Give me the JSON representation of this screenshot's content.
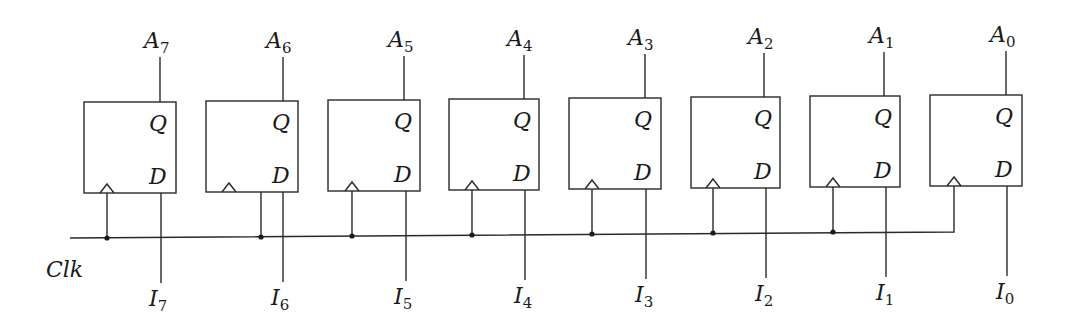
{
  "diagram": {
    "type": "8-bit parallel-load register (D flip-flops)",
    "clock_label": "Clk",
    "pin_labels": {
      "q": "Q",
      "d": "D"
    },
    "flipflops": [
      {
        "output": "A",
        "output_sub": "7",
        "input": "I",
        "input_sub": "7"
      },
      {
        "output": "A",
        "output_sub": "6",
        "input": "I",
        "input_sub": "6"
      },
      {
        "output": "A",
        "output_sub": "5",
        "input": "I",
        "input_sub": "5"
      },
      {
        "output": "A",
        "output_sub": "4",
        "input": "I",
        "input_sub": "4"
      },
      {
        "output": "A",
        "output_sub": "3",
        "input": "I",
        "input_sub": "3"
      },
      {
        "output": "A",
        "output_sub": "2",
        "input": "I",
        "input_sub": "2"
      },
      {
        "output": "A",
        "output_sub": "1",
        "input": "I",
        "input_sub": "1"
      },
      {
        "output": "A",
        "output_sub": "0",
        "input": "I",
        "input_sub": "0"
      }
    ]
  }
}
